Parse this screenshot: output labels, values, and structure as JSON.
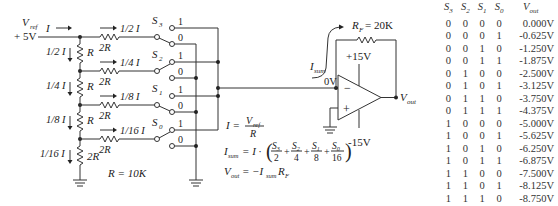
{
  "circuit": {
    "vref_label": "V",
    "vref_sub": "ref",
    "vref_value": "+ 5V",
    "input_current": "I",
    "ladder_currents": [
      "1/2 I",
      "1/4 I",
      "1/8 I",
      "1/16 I"
    ],
    "branch_currents": [
      "1/2 I",
      "1/4 I",
      "1/8 I",
      "1/16 I"
    ],
    "series_resistor": "R",
    "branch_resistor": "2R",
    "termination_resistor": "2R",
    "r_value": "R = 10K",
    "switches": [
      {
        "label": "S",
        "sub": "3",
        "on": "1",
        "off": "0"
      },
      {
        "label": "S",
        "sub": "2",
        "on": "1",
        "off": "0"
      },
      {
        "label": "S",
        "sub": "1",
        "on": "1",
        "off": "0"
      },
      {
        "label": "S",
        "sub": "0",
        "on": "1",
        "off": "0"
      }
    ],
    "feedback_resistor": {
      "label": "R",
      "sub": "F",
      "value": "= 20K"
    },
    "isum_label": "I",
    "isum_sub": "sum",
    "virtual_ground": "0V",
    "supply_pos": "+15V",
    "supply_neg": "-15V",
    "minus_sign": "−",
    "plus_sign": "+",
    "vout_label": "V",
    "vout_sub": "out"
  },
  "equations": {
    "eq1_lhs": "I =",
    "eq1_num": "V",
    "eq1_num_sub": "ref",
    "eq1_den": "R",
    "eq2_lhs": "I",
    "eq2_lhs_sub": "sum",
    "eq2_mid": "= I ·",
    "eq2_terms": [
      {
        "num": "S3",
        "den": "2"
      },
      {
        "num": "S2",
        "den": "4"
      },
      {
        "num": "S1",
        "den": "8"
      },
      {
        "num": "S0",
        "den": "16"
      }
    ],
    "eq3": "V",
    "eq3_sub": "out",
    "eq3_rhs": "= −I",
    "eq3_rhs_sub": "sum",
    "eq3_tail": "R",
    "eq3_tail_sub": "F"
  },
  "truth_table": {
    "headers": [
      "S3",
      "S2",
      "S1",
      "S0",
      "Vout"
    ],
    "rows": [
      [
        "0",
        "0",
        "0",
        "0",
        "0.000V"
      ],
      [
        "0",
        "0",
        "0",
        "1",
        "-0.625V"
      ],
      [
        "0",
        "0",
        "1",
        "0",
        "-1.250V"
      ],
      [
        "0",
        "0",
        "1",
        "1",
        "-1.875V"
      ],
      [
        "0",
        "1",
        "0",
        "0",
        "-2.500V"
      ],
      [
        "0",
        "1",
        "0",
        "1",
        "-3.125V"
      ],
      [
        "0",
        "1",
        "1",
        "0",
        "-3.750V"
      ],
      [
        "0",
        "1",
        "1",
        "1",
        "-4.375V"
      ],
      [
        "1",
        "0",
        "0",
        "0",
        "-5.000V"
      ],
      [
        "1",
        "0",
        "0",
        "1",
        "-5.625V"
      ],
      [
        "1",
        "0",
        "1",
        "0",
        "-6.250V"
      ],
      [
        "1",
        "0",
        "1",
        "1",
        "-6.875V"
      ],
      [
        "1",
        "1",
        "0",
        "0",
        "-7.500V"
      ],
      [
        "1",
        "1",
        "0",
        "1",
        "-8.125V"
      ],
      [
        "1",
        "1",
        "1",
        "0",
        "-8.750V"
      ],
      [
        "1",
        "1",
        "1",
        "1",
        "-9.375V"
      ]
    ]
  }
}
